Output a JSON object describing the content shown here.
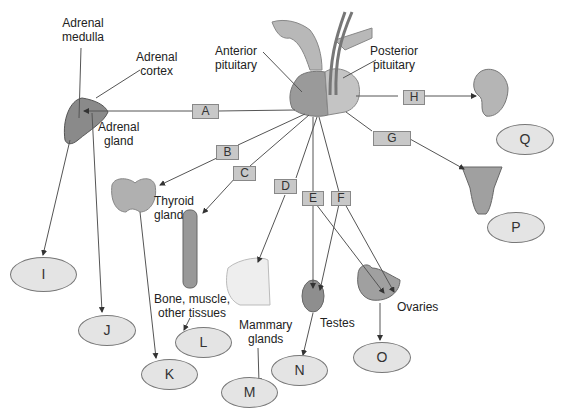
{
  "diagram": {
    "labels": {
      "adrenal_medulla": "Adrenal\nmedulla",
      "adrenal_cortex": "Adrenal\ncortex",
      "adrenal_gland": "Adrenal\ngland",
      "anterior_pituitary": "Anterior\npituitary",
      "posterior_pituitary": "Posterior\npituitary",
      "thyroid_gland": "Thyroid\ngland",
      "bone_muscle": "Bone, muscle,\nother tissues",
      "mammary_glands": "Mammary\nglands",
      "testes": "Testes",
      "ovaries": "Ovaries"
    },
    "hormone_boxes": [
      "A",
      "B",
      "C",
      "D",
      "E",
      "F",
      "G",
      "H"
    ],
    "effect_ovals": [
      "I",
      "J",
      "K",
      "L",
      "M",
      "N",
      "O",
      "P",
      "Q"
    ],
    "colors": {
      "box_fill": "#c8c8c8",
      "oval_fill": "#e4e4e4",
      "organ_gray": "#9a9a9a",
      "line": "#555555"
    }
  }
}
